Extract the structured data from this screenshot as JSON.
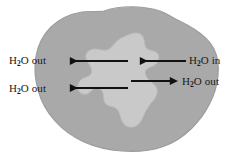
{
  "figure": {
    "background_color": "#ffffff",
    "outer_region": {
      "name": "outer-gray-blob",
      "fill_color": "#a9a9a9",
      "edge_color": "#9a9a9a"
    },
    "inner_region": {
      "name": "inner-light-blob",
      "fill_color": "#c9c9c9",
      "edge_color": "#bcbcbc"
    },
    "arrow_color": "#111111"
  },
  "labels": {
    "out_upper_left": {
      "formula": "H",
      "subscript": "2",
      "rest": "O out"
    },
    "out_lower_left": {
      "formula": "H",
      "subscript": "2",
      "rest": "O out"
    },
    "in_right": {
      "formula": "H",
      "subscript": "2",
      "rest": "O in"
    },
    "out_right": {
      "formula": "H",
      "subscript": "2",
      "rest": "O out"
    }
  },
  "arrows": [
    {
      "name": "arrow-out-upper-left",
      "direction": "left",
      "label": "H2O out",
      "x_start": 128,
      "x_end": 62,
      "y": 61
    },
    {
      "name": "arrow-in-right",
      "direction": "left",
      "label": "H2O in",
      "x_start": 186,
      "x_end": 132,
      "y": 61
    },
    {
      "name": "arrow-out-right",
      "direction": "right",
      "label": "H2O out",
      "x_start": 131,
      "x_end": 178,
      "y": 81
    },
    {
      "name": "arrow-out-lower-left",
      "direction": "left",
      "label": "H2O out",
      "x_start": 128,
      "x_end": 62,
      "y": 88
    }
  ]
}
